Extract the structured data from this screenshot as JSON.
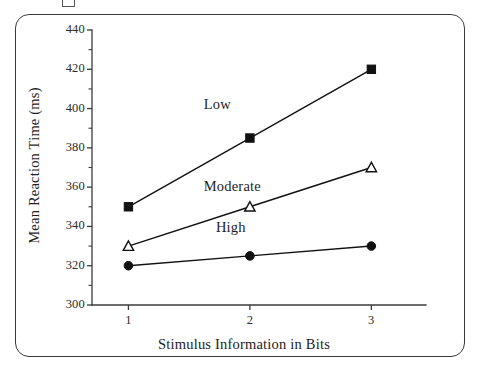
{
  "figure": {
    "frame_color": "#3a3a3a",
    "background": "#ffffff"
  },
  "chart_data": {
    "type": "line",
    "title": "",
    "xlabel": "Stimulus Information in Bits",
    "ylabel": "Mean Reaction Time (ms)",
    "x": [
      1,
      2,
      3
    ],
    "categories": [
      "1",
      "2",
      "3"
    ],
    "xtick_labels": [
      "1",
      "2",
      "3"
    ],
    "ytick_labels": [
      "300",
      "320",
      "340",
      "360",
      "380",
      "400",
      "420",
      "440"
    ],
    "ytick_values": [
      300,
      320,
      340,
      360,
      380,
      400,
      420,
      440
    ],
    "yminor_values": [
      310,
      330,
      350,
      370,
      390,
      410,
      430
    ],
    "xlim": [
      0.7,
      3.45
    ],
    "ylim": [
      300,
      440
    ],
    "grid": false,
    "legend_position": "inline-annotations",
    "series": [
      {
        "name": "Low",
        "label": "Low",
        "marker": "filled-square",
        "color": "#111111",
        "values": [
          350,
          385,
          420
        ],
        "label_x": 1.62,
        "label_y": 402
      },
      {
        "name": "Moderate",
        "label": "Moderate",
        "marker": "open-triangle",
        "color": "#111111",
        "values": [
          330,
          350,
          370
        ],
        "label_x": 1.62,
        "label_y": 360
      },
      {
        "name": "High",
        "label": "High",
        "marker": "filled-circle",
        "color": "#111111",
        "values": [
          320,
          325,
          330
        ],
        "label_x": 1.72,
        "label_y": 339
      }
    ]
  }
}
